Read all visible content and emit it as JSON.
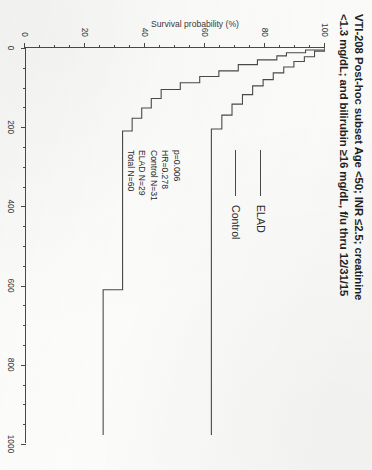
{
  "chart_data": {
    "type": "line",
    "title_line1": "VTI-208 Post-hoc subset Age <50; INR ≤2.5; creatinine",
    "title_line2": "<1.3 mg/dL; and bilirubin ≥16 mg/dL, f/u thru 12/31/15",
    "xlabel": "Days",
    "ylabel": "Survival probability (%)",
    "xlim": [
      0,
      1000
    ],
    "ylim": [
      0,
      100
    ],
    "xticks": [
      0,
      200,
      400,
      600,
      800,
      1000
    ],
    "xticklabels": [
      "0",
      "200",
      "400",
      "600",
      "800",
      "1000"
    ],
    "yticks": [
      0,
      20,
      40,
      60,
      80,
      100
    ],
    "yticklabels": [
      "0",
      "20",
      "40",
      "60",
      "80",
      "100"
    ],
    "grid": false,
    "legend_position": "center",
    "series": [
      {
        "name": "ELAD",
        "points": [
          [
            0,
            100
          ],
          [
            8,
            100
          ],
          [
            8,
            96.5
          ],
          [
            22,
            96.5
          ],
          [
            22,
            93.1
          ],
          [
            34,
            93.1
          ],
          [
            34,
            89.6
          ],
          [
            48,
            89.6
          ],
          [
            48,
            86.2
          ],
          [
            63,
            86.2
          ],
          [
            63,
            82.7
          ],
          [
            80,
            82.7
          ],
          [
            80,
            79.3
          ],
          [
            96,
            79.3
          ],
          [
            96,
            75.8
          ],
          [
            118,
            75.8
          ],
          [
            118,
            72.4
          ],
          [
            142,
            72.4
          ],
          [
            142,
            68.9
          ],
          [
            170,
            68.9
          ],
          [
            170,
            65.5
          ],
          [
            205,
            65.5
          ],
          [
            205,
            62.0
          ],
          [
            232,
            62.0
          ],
          [
            232,
            62.0
          ],
          [
            980,
            62.0
          ]
        ]
      },
      {
        "name": "Control",
        "points": [
          [
            0,
            100
          ],
          [
            5,
            100
          ],
          [
            5,
            93.5
          ],
          [
            12,
            93.5
          ],
          [
            12,
            87.1
          ],
          [
            20,
            87.1
          ],
          [
            20,
            83.9
          ],
          [
            30,
            83.9
          ],
          [
            30,
            77.4
          ],
          [
            42,
            77.4
          ],
          [
            42,
            71.0
          ],
          [
            58,
            71.0
          ],
          [
            58,
            64.5
          ],
          [
            72,
            64.5
          ],
          [
            72,
            58.1
          ],
          [
            88,
            58.1
          ],
          [
            88,
            51.6
          ],
          [
            105,
            51.6
          ],
          [
            105,
            45.2
          ],
          [
            128,
            45.2
          ],
          [
            128,
            41.9
          ],
          [
            152,
            41.9
          ],
          [
            152,
            38.7
          ],
          [
            178,
            38.7
          ],
          [
            178,
            35.5
          ],
          [
            210,
            35.5
          ],
          [
            210,
            32.3
          ],
          [
            232,
            32.3
          ],
          [
            232,
            32.3
          ],
          [
            612,
            32.3
          ],
          [
            612,
            25.8
          ],
          [
            980,
            25.8
          ]
        ]
      }
    ],
    "legend": [
      {
        "label": "ELAD"
      },
      {
        "label": "Control"
      }
    ],
    "annotations": {
      "p_value": "p=0.006",
      "hazard_ratio": "HR=0.278",
      "control_n": "Control N=31",
      "elad_n": "ELAD N=29",
      "total_n": "Total N=60"
    },
    "colors": {
      "axis": "#4a4a4a",
      "curve": "#4a4a4a",
      "text": "#2b2b2b",
      "background": "#fdfdfc"
    }
  }
}
